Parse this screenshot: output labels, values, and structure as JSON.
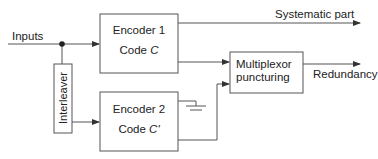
{
  "diagram": {
    "type": "turbo-encoder-block-diagram",
    "labels": {
      "inputs": "Inputs",
      "systematic": "Systematic part",
      "redundancy": "Redundancy",
      "interleaver": "Interleaver"
    },
    "blocks": {
      "encoder1": {
        "line1": "Encoder 1",
        "line2": "Code ",
        "code": "C"
      },
      "encoder2": {
        "line1": "Encoder 2",
        "line2": "Code ",
        "code": "C'"
      },
      "mux": {
        "line1": "Multiplexor",
        "line2": "puncturing"
      }
    },
    "colors": {
      "stroke": "#555555",
      "text": "#222222"
    }
  }
}
